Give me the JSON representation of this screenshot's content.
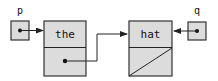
{
  "diagram": {
    "type": "linked-list-pointer-diagram",
    "pointers": [
      {
        "name": "p",
        "points_to": "node-1"
      },
      {
        "name": "q",
        "points_to": "node-2"
      }
    ],
    "nodes": [
      {
        "id": "node-1",
        "value": "the",
        "next": "node-2"
      },
      {
        "id": "node-2",
        "value": "hat",
        "next": null
      }
    ]
  },
  "labels": {
    "p": "p",
    "q": "q",
    "node1_value": "the",
    "node2_value": "hat"
  },
  "colors": {
    "box_fill": "#dcdcdc",
    "stroke": "#333333",
    "text": "#111111"
  }
}
